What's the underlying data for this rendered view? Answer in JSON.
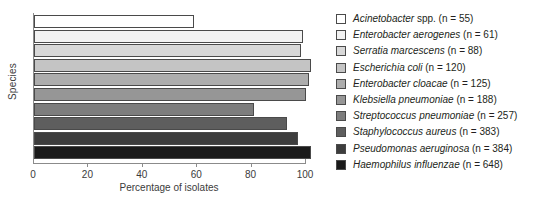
{
  "chart_data": {
    "type": "bar",
    "orientation": "horizontal",
    "title": "",
    "xlabel": "Percentage of isolates",
    "ylabel": "Species",
    "xlim": [
      0,
      100
    ],
    "xticks": [
      0,
      20,
      40,
      60,
      80,
      100
    ],
    "xtick_labels": [
      "0",
      "20",
      "40",
      "60",
      "80",
      "100"
    ],
    "grid": false,
    "legend_position": "right",
    "categories": [
      "Acinetobacter spp.",
      "Enterobacter aerogenes",
      "Serratia marcescens",
      "Escherichia coli",
      "Enterobacter cloacae",
      "Klebsiella pneumoniae",
      "Streptococcus pneumoniae",
      "Staphylococcus aureus",
      "Pseudomonas aeruginosa",
      "Haemophilus influenzae"
    ],
    "values": [
      59,
      99,
      98,
      102,
      101,
      100,
      81,
      93,
      97,
      102
    ],
    "bar_colors": [
      "#ffffff",
      "#f2f2f2",
      "#d8d8d8",
      "#c4c4c4",
      "#adadad",
      "#969696",
      "#7d7d7d",
      "#5e5e5e",
      "#3d3d3d",
      "#1a1a1a"
    ]
  },
  "legend": {
    "items": [
      {
        "name": "Acinetobacter",
        "plain": " spp. (n = 55)",
        "swatch": "#ffffff"
      },
      {
        "name": "Enterobacter aerogenes",
        "plain": " (n = 61)",
        "swatch": "#f2f2f2"
      },
      {
        "name": "Serratia marcescens",
        "plain": " (n = 88)",
        "swatch": "#d8d8d8"
      },
      {
        "name": "Escherichia coli",
        "plain": " (n = 120)",
        "swatch": "#c4c4c4"
      },
      {
        "name": "Enterobacter cloacae",
        "plain": " (n = 125)",
        "swatch": "#adadad"
      },
      {
        "name": "Klebsiella pneumoniae",
        "plain": " (n = 188)",
        "swatch": "#969696"
      },
      {
        "name": "Streptococcus pneumoniae",
        "plain": " (n = 257)",
        "swatch": "#7d7d7d"
      },
      {
        "name": "Staphylococcus aureus",
        "plain": " (n = 383)",
        "swatch": "#5e5e5e"
      },
      {
        "name": "Pseudomonas aeruginosa",
        "plain": " (n = 384)",
        "swatch": "#3d3d3d"
      },
      {
        "name": "Haemophilus influenzae",
        "plain": " (n = 648)",
        "swatch": "#1a1a1a"
      }
    ]
  }
}
